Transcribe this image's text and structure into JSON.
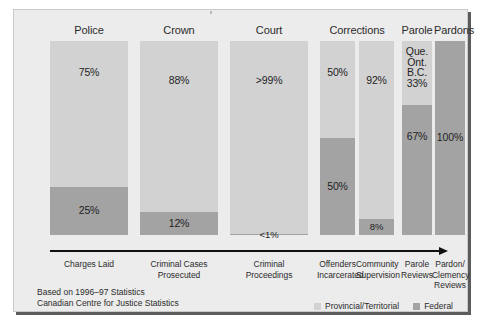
{
  "figure": {
    "background_color": "#ececec",
    "frame_border_color": "#c9c9c9",
    "shadow_color": "#5c5c5c"
  },
  "colors": {
    "provincial": "#d2d2d2",
    "federal": "#a3a3a3",
    "text": "#2b2b2b",
    "axis": "#111111"
  },
  "legend": {
    "position": "bottom-right",
    "items": [
      {
        "label": "Provincial/Territorial",
        "color": "#d2d2d2",
        "key": "provincial"
      },
      {
        "label": "Federal",
        "color": "#a3a3a3",
        "key": "federal"
      }
    ]
  },
  "source_note": {
    "line1": "Based on 1996–97 Statistics",
    "line2": "Canadian Centre for Justice Statistics"
  },
  "axis": {
    "type": "arrow",
    "direction": "left-to-right",
    "label": ""
  },
  "groups": [
    {
      "id": "police",
      "label": "Police"
    },
    {
      "id": "crown",
      "label": "Crown"
    },
    {
      "id": "court",
      "label": "Court"
    },
    {
      "id": "corrections",
      "label": "Corrections"
    },
    {
      "id": "parole",
      "label": "Parole"
    },
    {
      "id": "pardons",
      "label": "Pardons"
    }
  ],
  "chart_data": {
    "type": "bar",
    "subtype": "stacked-100-percent",
    "title": "",
    "subtitle": "",
    "xlabel": "",
    "ylabel": "",
    "ylim": [
      0,
      100
    ],
    "grid": false,
    "orientation": "vertical",
    "categories": [
      "Charges Laid",
      "Criminal Cases Prosecuted",
      "Criminal Proceedings",
      "Offenders Incarcerated",
      "Community Supervision",
      "Parole Reviews",
      "Pardon/Clemency Reviews"
    ],
    "group_of_category": [
      "Police",
      "Crown",
      "Court",
      "Corrections",
      "Corrections",
      "Parole",
      "Pardons"
    ],
    "series": [
      {
        "name": "Provincial/Territorial",
        "color": "#d2d2d2",
        "values": [
          75,
          88,
          99.5,
          50,
          92,
          33,
          0
        ],
        "display_labels": [
          "75%",
          "88%",
          ">99%",
          "50%",
          "92%",
          "Que.\nOnt.\nB.C.\n33%",
          ""
        ]
      },
      {
        "name": "Federal",
        "color": "#a3a3a3",
        "values": [
          25,
          12,
          0.5,
          50,
          8,
          67,
          100
        ],
        "display_labels": [
          "25%",
          "12%",
          "<1%",
          "50%",
          "8%",
          "67%",
          "100%"
        ]
      }
    ],
    "annotations": [
      {
        "category": "Parole Reviews",
        "segment": "Provincial/Territorial",
        "text": "Que. Ont. B.C. 33%"
      }
    ]
  },
  "bars": [
    {
      "id": "charges-laid",
      "group": "Police",
      "stage_label": "Charges Laid",
      "segments": [
        {
          "key": "provincial",
          "pct": 75,
          "label": "75%"
        },
        {
          "key": "federal",
          "pct": 25,
          "label": "25%"
        }
      ]
    },
    {
      "id": "criminal-cases-prosecuted",
      "group": "Crown",
      "stage_label": "Criminal Cases\nProsecuted",
      "segments": [
        {
          "key": "provincial",
          "pct": 88,
          "label": "88%"
        },
        {
          "key": "federal",
          "pct": 12,
          "label": "12%"
        }
      ]
    },
    {
      "id": "criminal-proceedings",
      "group": "Court",
      "stage_label": "Criminal\nProceedings",
      "segments": [
        {
          "key": "provincial",
          "pct": 99.5,
          "label": ">99%"
        },
        {
          "key": "federal",
          "pct": 0.5,
          "label": "<1%"
        }
      ]
    },
    {
      "id": "offenders-incarcerated",
      "group": "Corrections",
      "stage_label": "Offenders\nIncarcerated",
      "segments": [
        {
          "key": "provincial",
          "pct": 50,
          "label": "50%"
        },
        {
          "key": "federal",
          "pct": 50,
          "label": "50%"
        }
      ]
    },
    {
      "id": "community-supervision",
      "group": "Corrections",
      "stage_label": "Community\nSupervision",
      "segments": [
        {
          "key": "provincial",
          "pct": 92,
          "label": "92%"
        },
        {
          "key": "federal",
          "pct": 8,
          "label": "8%"
        }
      ]
    },
    {
      "id": "parole-reviews",
      "group": "Parole",
      "stage_label": "Parole\nReviews",
      "segments": [
        {
          "key": "provincial",
          "pct": 33,
          "label": "Que.\nOnt.\nB.C.\n33%"
        },
        {
          "key": "federal",
          "pct": 67,
          "label": "67%"
        }
      ]
    },
    {
      "id": "pardon-clemency-reviews",
      "group": "Pardons",
      "stage_label": "Pardon/\nClemency\nReviews",
      "segments": [
        {
          "key": "federal",
          "pct": 100,
          "label": "100%"
        }
      ]
    }
  ]
}
